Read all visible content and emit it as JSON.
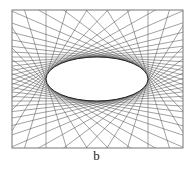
{
  "figure": {
    "caption": "b",
    "frame": {
      "x": 12,
      "y": 10,
      "width": 171,
      "height": 138,
      "stroke": "#777777"
    },
    "ellipse": {
      "cx": 97,
      "cy": 79,
      "rx": 51,
      "ry": 22
    },
    "tangent_lines": {
      "count": 48,
      "stroke": "#555555",
      "width": 0.55
    },
    "colors": {
      "background": "#ffffff",
      "ellipse_fill": "#ffffff"
    }
  }
}
